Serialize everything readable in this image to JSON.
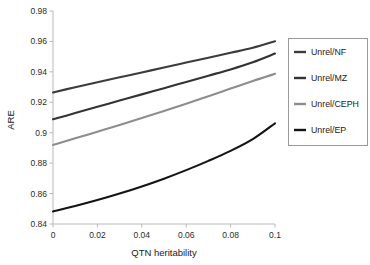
{
  "chart_data": {
    "type": "line",
    "title": "",
    "xlabel": "QTN heritability",
    "ylabel": "ARE",
    "xlim": [
      0,
      0.1
    ],
    "ylim": [
      0.84,
      0.98
    ],
    "grid": false,
    "legend_position": "right",
    "xticks": [
      0,
      0.02,
      0.04,
      0.06,
      0.08,
      0.1
    ],
    "xticklabels": [
      "0",
      "0.02",
      "0.04",
      "0.06",
      "0.08",
      "0.1"
    ],
    "yticks": [
      0.84,
      0.86,
      0.88,
      0.9,
      0.92,
      0.94,
      0.96,
      0.98
    ],
    "yticklabels": [
      "0.84",
      "0.86",
      "0.88",
      "0.9",
      "0.92",
      "0.94",
      "0.96",
      "0.98"
    ],
    "x": [
      0,
      0.01,
      0.02,
      0.03,
      0.04,
      0.05,
      0.06,
      0.07,
      0.08,
      0.09,
      0.1
    ],
    "series": [
      {
        "name": "Unrel/NF",
        "color": "#3c3c3c",
        "values": [
          0.9265,
          0.9299,
          0.9332,
          0.9364,
          0.9396,
          0.9429,
          0.9461,
          0.9493,
          0.9525,
          0.9558,
          0.9601
        ]
      },
      {
        "name": "Unrel/MZ",
        "color": "#333333",
        "values": [
          0.9088,
          0.9129,
          0.917,
          0.9211,
          0.9252,
          0.9293,
          0.9334,
          0.9375,
          0.9416,
          0.9463,
          0.952
        ]
      },
      {
        "name": "Unrel/CEPH",
        "color": "#8d8d8d",
        "values": [
          0.892,
          0.8963,
          0.9007,
          0.9051,
          0.9096,
          0.9142,
          0.919,
          0.924,
          0.929,
          0.934,
          0.9387
        ]
      },
      {
        "name": "Unrel/EP",
        "color": "#141414",
        "values": [
          0.8482,
          0.8518,
          0.8557,
          0.86,
          0.8647,
          0.8698,
          0.8754,
          0.8815,
          0.8881,
          0.8958,
          0.9062
        ]
      }
    ]
  },
  "legend": {
    "entries": [
      {
        "label": "Unrel/NF"
      },
      {
        "label": "Unrel/MZ"
      },
      {
        "label": "Unrel/CEPH"
      },
      {
        "label": "Unrel/EP"
      }
    ]
  }
}
